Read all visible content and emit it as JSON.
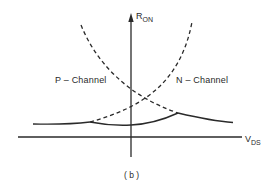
{
  "diagram": {
    "caption": "( b )",
    "y_axis": {
      "symbol": "R",
      "subscript": "ON"
    },
    "x_axis": {
      "symbol": "V",
      "subscript": "DS"
    },
    "curves": [
      {
        "label": "P – Channel",
        "style": "dashed then solid"
      },
      {
        "label": "N – Channel",
        "style": "dashed then solid"
      }
    ],
    "colors": {
      "line": "#2a2a2a",
      "background": "#ffffff"
    }
  }
}
